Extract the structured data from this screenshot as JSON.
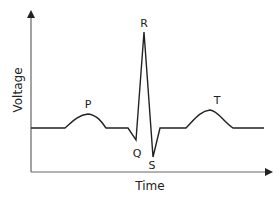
{
  "diagram": {
    "x_axis_label": "Time",
    "y_axis_label": "Voltage",
    "waves": [
      {
        "label": "P",
        "name": "P wave"
      },
      {
        "label": "Q",
        "name": "Q point"
      },
      {
        "label": "R",
        "name": "R peak"
      },
      {
        "label": "S",
        "name": "S point"
      },
      {
        "label": "T",
        "name": "T wave"
      }
    ],
    "colors": {
      "line": "#222222",
      "axis": "#555555",
      "background": "#ffffff"
    }
  }
}
